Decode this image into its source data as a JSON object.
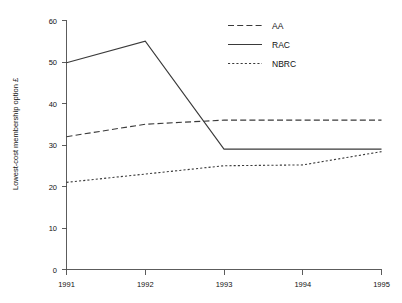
{
  "chart_data": {
    "type": "line",
    "title": "",
    "xlabel": "",
    "ylabel": "Lowest-cost membership option £",
    "categories": [
      "1991",
      "1992",
      "1993",
      "1994",
      "1995"
    ],
    "x": [
      1991,
      1992,
      1993,
      1994,
      1995
    ],
    "xlim": [
      1991,
      1995
    ],
    "ylim": [
      0,
      60
    ],
    "yticks": [
      "0",
      "10",
      "20",
      "30",
      "40",
      "50",
      "60"
    ],
    "ytick_values": [
      0,
      10,
      20,
      30,
      40,
      50,
      60
    ],
    "xticks": [
      "1991",
      "1992",
      "1993",
      "1994",
      "1995"
    ],
    "grid": false,
    "legend_position": "top-right",
    "series": [
      {
        "name": "AA",
        "style": "dashed",
        "values": [
          32,
          35,
          36,
          36,
          36
        ]
      },
      {
        "name": "RAC",
        "style": "solid",
        "values": [
          49.8,
          55,
          29,
          29,
          29
        ]
      },
      {
        "name": "NBRC",
        "style": "dotted",
        "values": [
          21,
          23,
          25,
          25.2,
          28.4
        ]
      }
    ]
  },
  "legend": {
    "items": [
      {
        "label": "AA",
        "style": "dashed"
      },
      {
        "label": "RAC",
        "style": "solid"
      },
      {
        "label": "NBRC",
        "style": "dotted"
      }
    ]
  },
  "axes": {
    "y_title": "Lowest-cost membership option £",
    "x_title": ""
  },
  "colors": {
    "line": "#3a3a3a",
    "axis": "#4a4a4a",
    "text": "#111111",
    "background": "#ffffff"
  }
}
